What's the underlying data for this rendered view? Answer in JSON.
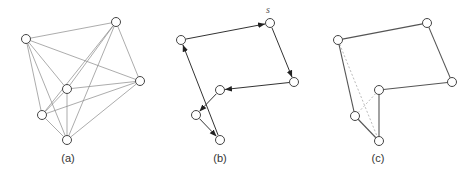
{
  "figure": {
    "panels": [
      {
        "id": "a",
        "caption": "(a)",
        "description": "complete graph on 6 nodes",
        "nodes": [
          [
            26,
            39
          ],
          [
            116,
            22
          ],
          [
            140,
            81
          ],
          [
            67,
            89
          ],
          [
            42,
            115
          ],
          [
            67,
            140
          ]
        ],
        "edges_solid": [
          [
            0,
            1
          ],
          [
            0,
            2
          ],
          [
            0,
            3
          ],
          [
            0,
            4
          ],
          [
            0,
            5
          ],
          [
            1,
            2
          ],
          [
            1,
            3
          ],
          [
            1,
            4
          ],
          [
            1,
            5
          ],
          [
            2,
            3
          ],
          [
            2,
            4
          ],
          [
            2,
            5
          ],
          [
            3,
            4
          ],
          [
            3,
            5
          ],
          [
            4,
            5
          ]
        ],
        "edges_dashed": [],
        "arrows": []
      },
      {
        "id": "b",
        "caption": "(b)",
        "description": "directed tour starting at s",
        "start_label": "s",
        "nodes": [
          [
            181,
            40
          ],
          [
            270,
            23
          ],
          [
            294,
            82
          ],
          [
            220,
            90
          ],
          [
            196,
            115
          ],
          [
            220,
            140
          ]
        ],
        "arrows": [
          [
            0,
            1
          ],
          [
            1,
            2
          ],
          [
            2,
            3
          ],
          [
            3,
            4
          ],
          [
            4,
            5
          ],
          [
            5,
            0
          ]
        ],
        "edges_solid": [],
        "edges_dashed": []
      },
      {
        "id": "c",
        "caption": "(c)",
        "description": "tour after 2-opt exchange; removed edges dashed",
        "nodes": [
          [
            338,
            40
          ],
          [
            427,
            23
          ],
          [
            452,
            82
          ],
          [
            379,
            90
          ],
          [
            355,
            116
          ],
          [
            379,
            141
          ]
        ],
        "edges_solid": [
          [
            0,
            1
          ],
          [
            1,
            2
          ],
          [
            2,
            3
          ],
          [
            3,
            5
          ],
          [
            5,
            4
          ],
          [
            4,
            0
          ]
        ],
        "edges_dashed": [
          [
            0,
            5
          ],
          [
            4,
            3
          ]
        ],
        "arrows": []
      }
    ],
    "colors": {
      "line": "#555555",
      "light_line": "#888888",
      "dashed": "#aaaaaa",
      "node_fill": "#ffffff",
      "node_stroke": "#444444"
    }
  }
}
